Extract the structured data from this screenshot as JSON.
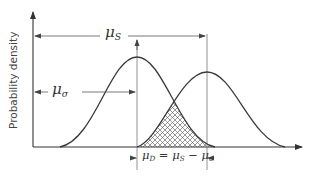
{
  "figure": {
    "type": "probability-density-overlap",
    "y_axis_label": "Probability density",
    "labels": {
      "mu_s": {
        "symbol": "μ",
        "sub": "S"
      },
      "mu_sigma": {
        "symbol": "μ",
        "sub": "σ"
      },
      "mu_d_equation": {
        "lhs_symbol": "μ",
        "lhs_sub": "D",
        "eq": " = ",
        "a_symbol": "μ",
        "a_sub": "S",
        "op": " − ",
        "b_symbol": "μ",
        "b_sub": "σ"
      }
    },
    "curves": [
      {
        "name": "stress-distribution",
        "mean_label": "μσ",
        "peak_x": 137,
        "peak_y": 57,
        "taller": true
      },
      {
        "name": "strength-distribution",
        "mean_label": "μS",
        "peak_x": 207,
        "peak_y": 72,
        "taller": false
      }
    ],
    "overlap_region": {
      "style": "cross-hatched",
      "meaning": "interference / failure region"
    },
    "colors": {
      "line": "#3a3a3a",
      "guide": "#777777",
      "background": "#ffffff"
    }
  }
}
